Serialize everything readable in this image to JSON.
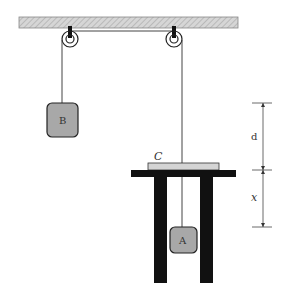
{
  "diagram": {
    "type": "pulley-system",
    "labels": {
      "block_b": "B",
      "block_a": "A",
      "platform": "C",
      "dim_upper": "d",
      "dim_lower": "x"
    },
    "colors": {
      "ceiling_fill": "#cfcfcf",
      "block_fill": "#a8a8a8",
      "platform_fill": "#d4d4d4",
      "structure": "#111111",
      "rope": "#444444"
    }
  }
}
